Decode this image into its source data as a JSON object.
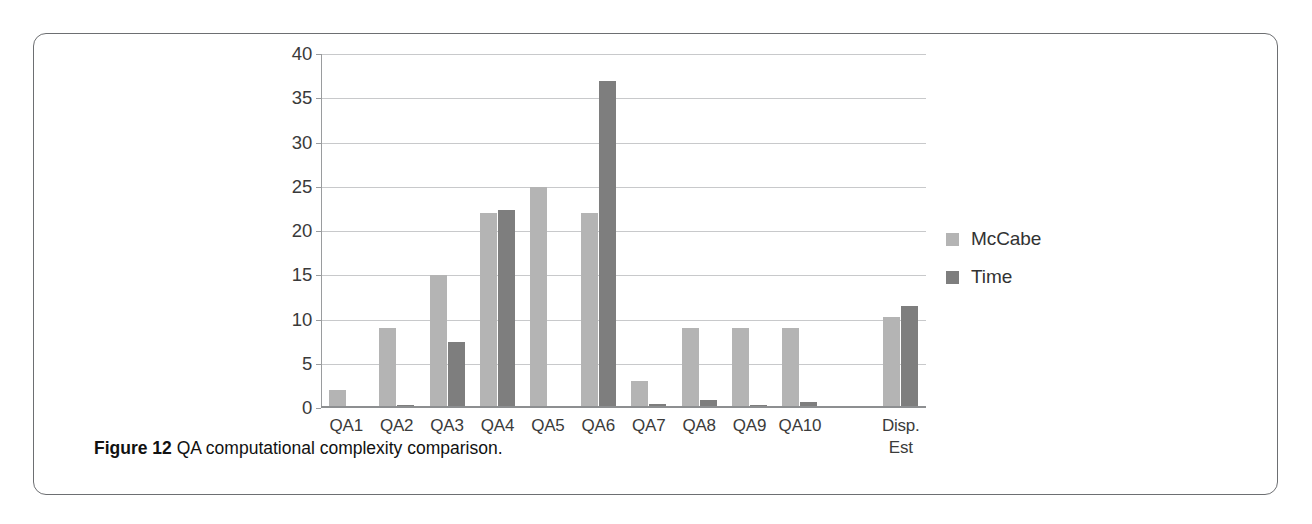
{
  "figure": {
    "caption_label": "Figure 12",
    "caption_text": "QA computational complexity comparison."
  },
  "legend": {
    "items": [
      {
        "label": "McCabe",
        "color": "#b4b4b4",
        "swatch_name": "legend-swatch-mccabe"
      },
      {
        "label": "Time",
        "color": "#7e7e7e",
        "swatch_name": "legend-swatch-time"
      }
    ]
  },
  "chart_data": {
    "type": "bar",
    "title": "QA computational complexity comparison",
    "xlabel": "",
    "ylabel": "",
    "ylim": [
      0,
      40
    ],
    "yticks": [
      0,
      5,
      10,
      15,
      20,
      25,
      30,
      35,
      40
    ],
    "ytick_labels": [
      "0",
      "5",
      "10",
      "15",
      "20",
      "25",
      "30",
      "35",
      "40"
    ],
    "grid": true,
    "grid_axis": "y",
    "legend_position": "right",
    "categories": [
      "QA1",
      "QA2",
      "QA3",
      "QA4",
      "QA5",
      "QA6",
      "QA7",
      "QA8",
      "QA9",
      "QA10",
      "",
      "Disp.\nEst"
    ],
    "series": [
      {
        "name": "McCabe",
        "color": "#b4b4b4",
        "values": [
          2,
          9,
          15,
          22,
          25,
          22,
          3,
          9,
          9,
          9,
          0,
          10.3
        ]
      },
      {
        "name": "Time",
        "color": "#7e7e7e",
        "values": [
          0.2,
          0.3,
          7.5,
          22.4,
          0.1,
          37,
          0.5,
          0.9,
          0.3,
          0.7,
          0,
          11.5
        ]
      }
    ]
  }
}
